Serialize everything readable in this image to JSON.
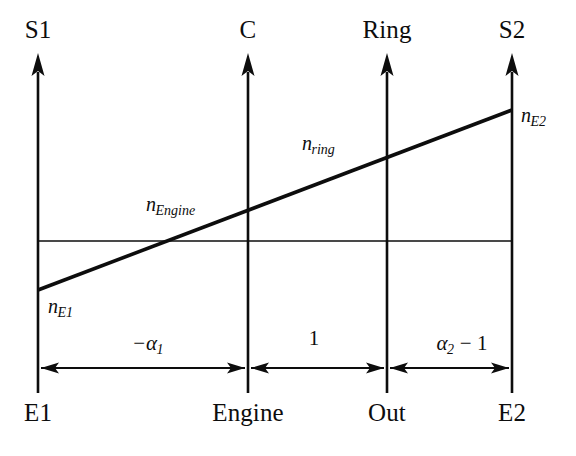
{
  "figure": {
    "type": "lever-diagram",
    "width": 576,
    "height": 456,
    "background_color": "#ffffff",
    "line_color": "#0d0d0d"
  },
  "axes": [
    {
      "id": "s1",
      "top_label": "S1",
      "bottom_label": "E1",
      "x": 38,
      "direction": "up"
    },
    {
      "id": "c",
      "top_label": "C",
      "bottom_label": "Engine",
      "x": 248,
      "direction": "up"
    },
    {
      "id": "ring",
      "top_label": "Ring",
      "bottom_label": "Out",
      "x": 387,
      "direction": "up"
    },
    {
      "id": "s2",
      "top_label": "S2",
      "bottom_label": "E2",
      "x": 512,
      "direction": "up"
    }
  ],
  "zero_line": {
    "label": "",
    "y": 241,
    "x_start": 38,
    "x_end": 512
  },
  "lever_line": {
    "from": {
      "x": 38,
      "y": 290
    },
    "to": {
      "x": 512,
      "y": 110
    },
    "points": [
      {
        "axis": "s1",
        "label": "n_E1"
      },
      {
        "axis": "c",
        "label": "n_Engine"
      },
      {
        "axis": "ring",
        "label": "n_ring"
      },
      {
        "axis": "s2",
        "label": "n_E2"
      }
    ]
  },
  "speed_labels": [
    {
      "id": "n-e1",
      "base": "n",
      "sub": "E1",
      "x": 48,
      "y": 296
    },
    {
      "id": "n-engine",
      "base": "n",
      "sub": "Engine",
      "x": 146,
      "y": 194
    },
    {
      "id": "n-ring",
      "base": "n",
      "sub": "ring",
      "x": 302,
      "y": 133
    },
    {
      "id": "n-e2",
      "base": "n",
      "sub": "E2",
      "x": 521,
      "y": 105
    }
  ],
  "dimensions": [
    {
      "id": "alpha1",
      "text_prefix": "−α",
      "sub": "1",
      "text_suffix": "",
      "from_axis": "s1",
      "to_axis": "c",
      "x_start": 38,
      "x_end": 248,
      "label_x": 148,
      "y": 368
    },
    {
      "id": "one",
      "text_prefix": "1",
      "sub": "",
      "text_suffix": "",
      "from_axis": "c",
      "to_axis": "ring",
      "x_start": 248,
      "x_end": 387,
      "label_x": 313,
      "y": 368
    },
    {
      "id": "alpha2minus1",
      "text_prefix": "α",
      "sub": "2",
      "text_suffix": " − 1",
      "from_axis": "ring",
      "to_axis": "s2",
      "x_start": 387,
      "x_end": 512,
      "label_x": 462,
      "y": 368
    }
  ]
}
